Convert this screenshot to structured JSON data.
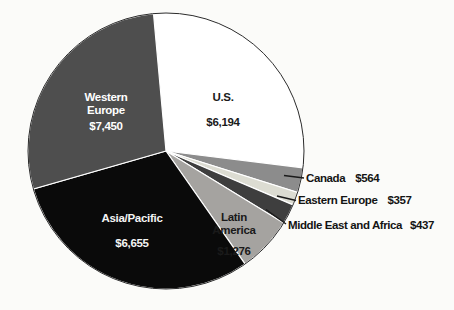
{
  "figure": {
    "background": "#fbfbf9",
    "outline_color": "#2b2b2b",
    "separator_color": "#ffffff",
    "leader_line_color": "#1a1a1a",
    "external_label_color": "#141414"
  },
  "chart_data": {
    "type": "pie",
    "title": "",
    "legend": "none",
    "start_position": "top",
    "direction": "clockwise",
    "categories": [
      "U.S.",
      "Canada",
      "Eastern Europe",
      "Middle East and Africa",
      "Latin America",
      "Asia/Pacific",
      "Western Europe"
    ],
    "values": [
      6194,
      564,
      357,
      437,
      1276,
      6655,
      7450
    ],
    "segments": [
      {
        "label": "U.S.",
        "value": 6194,
        "display_value": "$6,194",
        "color": "#ffffff",
        "text_color": "#1a1a1a",
        "label_placement": "inside",
        "start_deg": -5.2,
        "end_deg": 97
      },
      {
        "label": "Canada",
        "value": 564,
        "display_value": "$564",
        "color": "#8c8c8c",
        "text_color": "#141414",
        "label_placement": "outside",
        "start_deg": 97,
        "end_deg": 107.5
      },
      {
        "label": "Eastern Europe",
        "value": 357,
        "display_value": "$357",
        "color": "#dcdcd2",
        "text_color": "#141414",
        "label_placement": "outside",
        "start_deg": 107.5,
        "end_deg": 113
      },
      {
        "label": "Middle East and Africa",
        "value": 437,
        "display_value": "$437",
        "color": "#3e3e3e",
        "text_color": "#141414",
        "label_placement": "outside",
        "start_deg": 113,
        "end_deg": 121.5
      },
      {
        "label": "Latin America",
        "value": 1276,
        "display_value": "$1,276",
        "color": "#a5a3a0",
        "text_color": "#1a1a1a",
        "label_placement": "inside",
        "start_deg": 121.5,
        "end_deg": 145
      },
      {
        "label": "Asia/Pacific",
        "value": 6655,
        "display_value": "$6,655",
        "color": "#0a0a0a",
        "text_color": "#f4f4f4",
        "label_placement": "inside",
        "start_deg": 145,
        "end_deg": 254
      },
      {
        "label": "Western Europe",
        "value": 7450,
        "display_value": "$7,450",
        "color": "#4e4e4e",
        "text_color": "#ffffff",
        "label_placement": "inside",
        "start_deg": 254,
        "end_deg": 354.8
      }
    ]
  }
}
